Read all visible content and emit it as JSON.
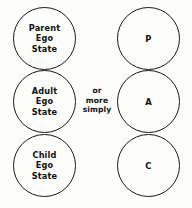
{
  "diagram": {
    "background_color": "#fdfdfc",
    "stroke_color": "#181818",
    "text_color": "#111111",
    "connector_note": "or\nmore\nsimply",
    "left_column": {
      "name": "full-names-column",
      "circles": [
        {
          "id": "parent",
          "label": "Parent\nEgo\nState"
        },
        {
          "id": "adult",
          "label": "Adult\nEgo\nState"
        },
        {
          "id": "child",
          "label": "Child\nEgo\nState"
        }
      ]
    },
    "right_column": {
      "name": "abbreviations-column",
      "circles": [
        {
          "id": "parent",
          "label": "P"
        },
        {
          "id": "adult",
          "label": "A"
        },
        {
          "id": "child",
          "label": "C"
        }
      ]
    }
  }
}
